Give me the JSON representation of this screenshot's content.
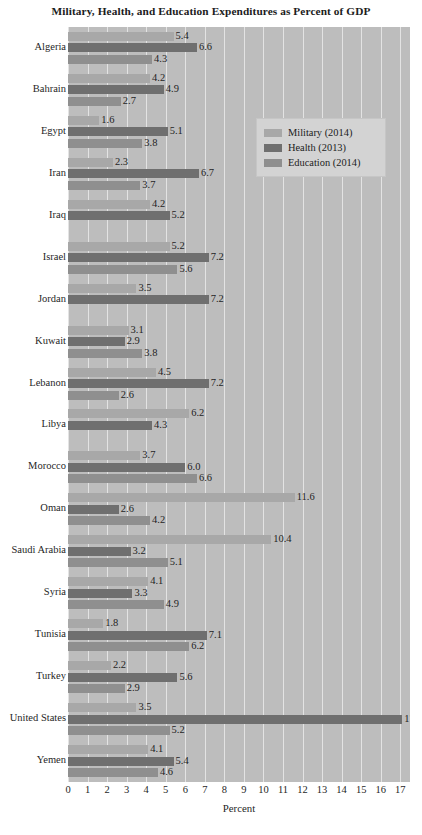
{
  "chart_data": {
    "type": "bar",
    "orientation": "horizontal",
    "title": "Military, Health, and Education Expenditures as Percent of GDP",
    "xlabel": "Percent",
    "ylabel": "",
    "xlim": [
      0,
      17.5
    ],
    "xticks": [
      0,
      1,
      2,
      3,
      4,
      5,
      6,
      7,
      8,
      9,
      10,
      11,
      12,
      13,
      14,
      15,
      16,
      17
    ],
    "grid": true,
    "legend_position": "upper-right-inside",
    "categories": [
      "Algeria",
      "Bahrain",
      "Egypt",
      "Iran",
      "Iraq",
      "Israel",
      "Jordan",
      "Kuwait",
      "Lebanon",
      "Libya",
      "Morocco",
      "Oman",
      "Saudi Arabia",
      "Syria",
      "Tunisia",
      "Turkey",
      "United States",
      "Yemen"
    ],
    "series": [
      {
        "name": "Military (2014)",
        "color": "#a8a8a8",
        "values": [
          5.4,
          4.2,
          1.6,
          2.3,
          4.2,
          5.2,
          3.5,
          3.1,
          4.5,
          6.2,
          3.7,
          11.6,
          10.4,
          4.1,
          1.8,
          2.2,
          3.5,
          4.1
        ],
        "labels": [
          "5.4",
          "4.2",
          "1.6",
          "2.3",
          "4.2",
          "5.2",
          "3.5",
          "3.1",
          "4.5",
          "6.2",
          "3.7",
          "11.6",
          "10.4",
          "4.1",
          "1.8",
          "2.2",
          "3.5",
          "4.1"
        ]
      },
      {
        "name": "Health (2013)",
        "color": "#6f6f6f",
        "values": [
          6.6,
          4.9,
          5.1,
          6.7,
          5.2,
          7.2,
          7.2,
          2.9,
          7.2,
          4.3,
          6.0,
          2.6,
          3.2,
          3.3,
          7.1,
          5.6,
          17.1,
          5.4
        ],
        "labels": [
          "6.6",
          "4.9",
          "5.1",
          "6.7",
          "5.2",
          "7.2",
          "7.2",
          "2.9",
          "7.2",
          "4.3",
          "6.0",
          "2.6",
          "3.2",
          "3.3",
          "7.1",
          "5.6",
          "17.1",
          "5.4"
        ]
      },
      {
        "name": "Education (2014)",
        "color": "#8f8f8f",
        "values": [
          4.3,
          2.7,
          3.8,
          3.7,
          null,
          5.6,
          null,
          3.8,
          2.6,
          null,
          6.6,
          4.2,
          5.1,
          4.9,
          6.2,
          2.9,
          5.2,
          4.6
        ],
        "labels": [
          "4.3",
          "2.7",
          "3.8",
          "3.7",
          "",
          "5.6",
          "",
          "3.8",
          "2.6",
          "",
          "6.6",
          "4.2",
          "5.1",
          "4.9",
          "6.2",
          "2.9",
          "5.2",
          "4.6"
        ]
      }
    ]
  },
  "legend": {
    "items": [
      {
        "label": "Military (2014)",
        "key": "military"
      },
      {
        "label": "Health (2013)",
        "key": "health"
      },
      {
        "label": "Education (2014)",
        "key": "education"
      }
    ]
  },
  "colors": {
    "military": "#a8a8a8",
    "health": "#6f6f6f",
    "education": "#8f8f8f",
    "plot_background": "#bdbdbd",
    "gridline": "#e3e3e3",
    "text": "#1f1f1f",
    "page_background": "#ffffff"
  }
}
